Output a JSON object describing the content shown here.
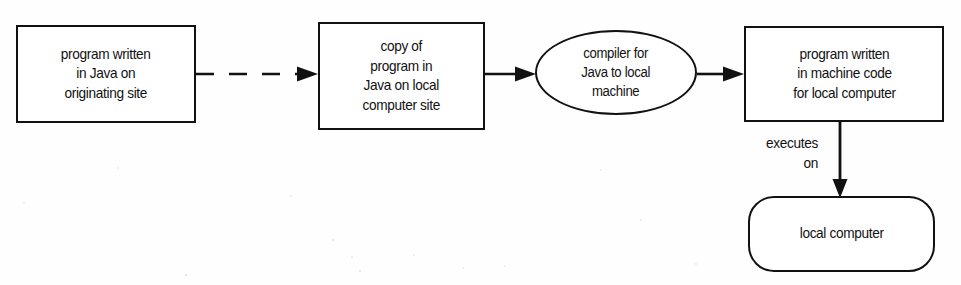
{
  "diagram": {
    "background_color": "#fefeff",
    "stroke_color": "#111111",
    "nodes": [
      {
        "id": "source-program",
        "shape": "rectangle",
        "label": "program written\nin Java on\noriginating site"
      },
      {
        "id": "copied-program",
        "shape": "rectangle",
        "label": "copy of\nprogram in\nJava on local\ncomputer site"
      },
      {
        "id": "compiler",
        "shape": "ellipse",
        "label": "compiler for\nJava to local\nmachine"
      },
      {
        "id": "machine-code-program",
        "shape": "rectangle",
        "label": "program written\nin machine code\nfor local computer"
      },
      {
        "id": "local-computer",
        "shape": "rounded-rectangle",
        "label": "local computer"
      }
    ],
    "edges": [
      {
        "id": "transfer-edge",
        "from": "source-program",
        "to": "copied-program",
        "style": "dashed",
        "arrow": "single",
        "label": ""
      },
      {
        "id": "to-compiler-edge",
        "from": "copied-program",
        "to": "compiler",
        "style": "solid",
        "arrow": "single",
        "label": ""
      },
      {
        "id": "to-machine-code-edge",
        "from": "compiler",
        "to": "machine-code-program",
        "style": "solid",
        "arrow": "single",
        "label": ""
      },
      {
        "id": "executes-on-edge",
        "from": "machine-code-program",
        "to": "local-computer",
        "style": "solid",
        "arrow": "single",
        "label": "executes\non"
      }
    ]
  }
}
